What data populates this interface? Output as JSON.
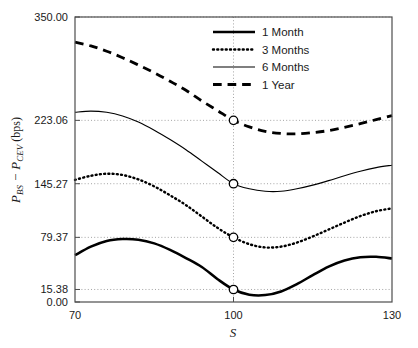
{
  "chart_data": {
    "type": "line",
    "title": "",
    "xlabel": "S",
    "ylabel": "P_BS - P_CEV (bps)",
    "ylabel_parts": {
      "p1": "P",
      "sub1": "BS",
      "minus": "−",
      "p2": "P",
      "sub2": "CEV",
      "unit": "(bps)"
    },
    "xlim": [
      70,
      130
    ],
    "ylim": [
      0,
      350
    ],
    "grid": true,
    "grid_style": "dotted",
    "xticks": [
      70,
      100,
      130
    ],
    "xtick_labels": [
      "70",
      "100",
      "130"
    ],
    "yticks": [
      0.0,
      15.38,
      79.37,
      145.27,
      223.06,
      350.0
    ],
    "ytick_labels": [
      "0.00",
      "15.38",
      "79.37",
      "145.27",
      "223.06",
      "350.00"
    ],
    "legend_position": "top-right",
    "legend_entries": [
      "1 Month",
      "3 Months",
      "6 Months",
      "1 Year"
    ],
    "marker_x": 100,
    "markers": [
      {
        "series": "1 Month",
        "x": 100,
        "y": 15.38
      },
      {
        "series": "3 Months",
        "x": 100,
        "y": 79.37
      },
      {
        "series": "6 Months",
        "x": 100,
        "y": 145.27
      },
      {
        "series": "1 Year",
        "x": 100,
        "y": 223.06
      }
    ],
    "x": [
      70,
      73,
      76,
      79,
      82,
      85,
      88,
      91,
      94,
      97,
      100,
      103,
      106,
      109,
      112,
      115,
      118,
      121,
      124,
      127,
      130
    ],
    "series": [
      {
        "name": "1 Month",
        "style": "solid-thick",
        "color": "#000000",
        "linewidth": 2.6,
        "values": [
          57.5,
          68.0,
          75.0,
          77.3,
          76.5,
          72.0,
          64.0,
          54.0,
          43.0,
          28.0,
          15.38,
          9.0,
          8.5,
          13.0,
          22.0,
          33.0,
          43.5,
          51.0,
          55.0,
          55.5,
          53.5
        ]
      },
      {
        "name": "3 Months",
        "style": "dotted",
        "color": "#000000",
        "linewidth": 2.4,
        "values": [
          150.0,
          155.0,
          157.5,
          156.0,
          150.5,
          142.0,
          131.0,
          119.0,
          105.0,
          91.0,
          79.37,
          71.0,
          67.0,
          68.0,
          73.0,
          80.5,
          89.0,
          97.5,
          105.5,
          111.5,
          115.0
        ]
      },
      {
        "name": "6 Months",
        "style": "solid-thin",
        "color": "#000000",
        "linewidth": 1.15,
        "values": [
          233.0,
          234.5,
          233.0,
          228.5,
          221.0,
          211.0,
          199.5,
          187.0,
          173.0,
          159.0,
          145.27,
          139.0,
          136.0,
          136.0,
          139.0,
          143.5,
          149.0,
          155.0,
          160.5,
          165.0,
          168.0
        ]
      },
      {
        "name": "1 Year",
        "style": "dashed",
        "color": "#000000",
        "linewidth": 2.8,
        "values": [
          319.0,
          314.5,
          308.0,
          300.0,
          291.0,
          281.5,
          271.0,
          260.0,
          247.0,
          235.0,
          223.06,
          215.0,
          209.5,
          207.0,
          206.5,
          208.0,
          210.5,
          214.5,
          219.0,
          224.0,
          229.0
        ]
      }
    ]
  }
}
